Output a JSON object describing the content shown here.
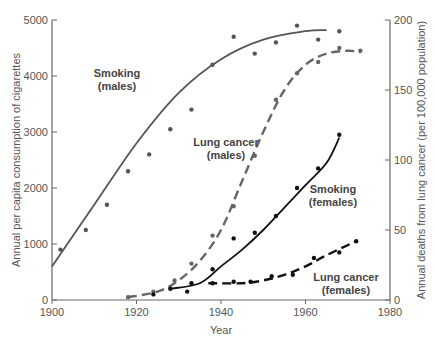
{
  "chart_data": {
    "type": "line",
    "title": "",
    "xlabel": "Year",
    "ylabel_left": "Annual per capita consumption of cigarettes",
    "ylabel_right": "Annual deaths from lung cancer (per 100,000 population)",
    "xlim": [
      1900,
      1980
    ],
    "ylim_left": [
      0,
      5000
    ],
    "ylim_right": [
      0,
      200
    ],
    "x_ticks": [
      "1900",
      "1920",
      "1940",
      "1960",
      "1980"
    ],
    "y_ticks_left": [
      "0",
      "1000",
      "2000",
      "3000",
      "4000",
      "5000"
    ],
    "y_ticks_right": [
      "0",
      "50",
      "100",
      "150",
      "200"
    ],
    "grid": false,
    "series": [
      {
        "name": "Smoking (males)",
        "axis": "left",
        "style": "solid",
        "color": "#555555",
        "curve": [
          [
            1900,
            600
          ],
          [
            1910,
            1700
          ],
          [
            1920,
            2800
          ],
          [
            1930,
            3700
          ],
          [
            1940,
            4300
          ],
          [
            1950,
            4650
          ],
          [
            1960,
            4800
          ],
          [
            1965,
            4820
          ]
        ],
        "points": [
          [
            1902,
            900
          ],
          [
            1908,
            1250
          ],
          [
            1913,
            1700
          ],
          [
            1918,
            2300
          ],
          [
            1923,
            2600
          ],
          [
            1928,
            3050
          ],
          [
            1933,
            3400
          ],
          [
            1938,
            4200
          ],
          [
            1943,
            4700
          ],
          [
            1948,
            4400
          ],
          [
            1953,
            4600
          ],
          [
            1958,
            4900
          ],
          [
            1963,
            4650
          ],
          [
            1968,
            4800
          ]
        ]
      },
      {
        "name": "Lung cancer (males)",
        "axis": "right",
        "style": "dashed",
        "color": "#666666",
        "curve": [
          [
            1918,
            2
          ],
          [
            1925,
            6
          ],
          [
            1930,
            14
          ],
          [
            1935,
            28
          ],
          [
            1940,
            50
          ],
          [
            1945,
            85
          ],
          [
            1950,
            120
          ],
          [
            1955,
            150
          ],
          [
            1960,
            168
          ],
          [
            1965,
            176
          ],
          [
            1970,
            178
          ],
          [
            1973,
            177
          ]
        ],
        "points": [
          [
            1918,
            2
          ],
          [
            1924,
            6
          ],
          [
            1929,
            14
          ],
          [
            1933,
            26
          ],
          [
            1938,
            46
          ],
          [
            1943,
            67
          ],
          [
            1948,
            103
          ],
          [
            1953,
            143
          ],
          [
            1958,
            162
          ],
          [
            1963,
            170
          ],
          [
            1968,
            180
          ],
          [
            1973,
            178
          ]
        ]
      },
      {
        "name": "Smoking (females)",
        "axis": "left",
        "style": "solid",
        "color": "#111111",
        "curve": [
          [
            1928,
            200
          ],
          [
            1935,
            300
          ],
          [
            1940,
            600
          ],
          [
            1945,
            900
          ],
          [
            1950,
            1250
          ],
          [
            1955,
            1650
          ],
          [
            1960,
            2050
          ],
          [
            1965,
            2450
          ],
          [
            1968,
            2900
          ]
        ],
        "points": [
          [
            1924,
            100
          ],
          [
            1928,
            200
          ],
          [
            1932,
            150
          ],
          [
            1933,
            300
          ],
          [
            1938,
            550
          ],
          [
            1943,
            1100
          ],
          [
            1948,
            1200
          ],
          [
            1953,
            1500
          ],
          [
            1958,
            2000
          ],
          [
            1963,
            2350
          ],
          [
            1968,
            2950
          ]
        ]
      },
      {
        "name": "Lung cancer (females)",
        "axis": "right",
        "style": "dashed",
        "color": "#111111",
        "curve": [
          [
            1937,
            12
          ],
          [
            1945,
            12
          ],
          [
            1950,
            14
          ],
          [
            1955,
            18
          ],
          [
            1960,
            24
          ],
          [
            1965,
            32
          ],
          [
            1972,
            42
          ]
        ],
        "points": [
          [
            1938,
            12
          ],
          [
            1943,
            13
          ],
          [
            1947,
            13
          ],
          [
            1952,
            17
          ],
          [
            1957,
            18
          ],
          [
            1962,
            30
          ],
          [
            1968,
            34
          ],
          [
            1972,
            42
          ]
        ]
      }
    ],
    "annotations": [
      {
        "text": "Smoking (males)",
        "x": 1923,
        "y": 4200
      },
      {
        "text": "Lung cancer (males)",
        "x": 1937,
        "y": 3250
      },
      {
        "text": "Smoking (females)",
        "x": 1960,
        "y": 2100
      },
      {
        "text": "Lung cancer (females)",
        "x": 1965,
        "y": 400
      }
    ]
  },
  "labels": {
    "smoking_males_1": "Smoking",
    "smoking_males_2": "(males)",
    "lc_males_1": "Lung cancer",
    "lc_males_2": "(males)",
    "smoking_females_1": "Smoking",
    "smoking_females_2": "(females)",
    "lc_females_1": "Lung cancer",
    "lc_females_2": "(females)"
  }
}
